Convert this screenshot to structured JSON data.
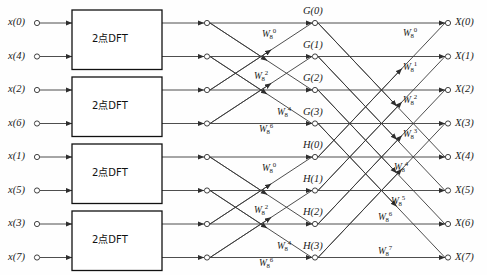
{
  "figure": {
    "type": "signal-flow-graph",
    "width": 487,
    "height": 275,
    "line_color": "#3a3a3a",
    "text_color": "#1a1a1a",
    "background": "#fefefe"
  },
  "inputs": [
    {
      "label": "x(0)",
      "row": 0
    },
    {
      "label": "x(4)",
      "row": 1
    },
    {
      "label": "x(2)",
      "row": 2
    },
    {
      "label": "x(6)",
      "row": 3
    },
    {
      "label": "x(1)",
      "row": 4
    },
    {
      "label": "x(5)",
      "row": 5
    },
    {
      "label": "x(3)",
      "row": 6
    },
    {
      "label": "x(7)",
      "row": 7
    }
  ],
  "outputs": [
    {
      "label": "X(0)",
      "row": 0
    },
    {
      "label": "X(1)",
      "row": 1
    },
    {
      "label": "X(2)",
      "row": 2
    },
    {
      "label": "X(3)",
      "row": 3
    },
    {
      "label": "X(4)",
      "row": 4
    },
    {
      "label": "X(5)",
      "row": 5
    },
    {
      "label": "X(6)",
      "row": 6
    },
    {
      "label": "X(7)",
      "row": 7
    }
  ],
  "dft_blocks": [
    {
      "label": "2点DFT",
      "rows": [
        0,
        1
      ]
    },
    {
      "label": "2点DFT",
      "rows": [
        2,
        3
      ]
    },
    {
      "label": "2点DFT",
      "rows": [
        4,
        5
      ]
    },
    {
      "label": "2点DFT",
      "rows": [
        6,
        7
      ]
    }
  ],
  "intermediate_nodes": [
    {
      "label": "G(0)",
      "row": 0
    },
    {
      "label": "G(1)",
      "row": 1
    },
    {
      "label": "G(2)",
      "row": 2
    },
    {
      "label": "G(3)",
      "row": 3
    },
    {
      "label": "H(0)",
      "row": 4
    },
    {
      "label": "H(1)",
      "row": 5
    },
    {
      "label": "H(2)",
      "row": 6
    },
    {
      "label": "H(3)",
      "row": 7
    }
  ],
  "stage2_twiddles": [
    {
      "base": "W",
      "sub": "8",
      "sup": "0",
      "row": 0,
      "group": "G"
    },
    {
      "base": "W",
      "sub": "8",
      "sup": "2",
      "row": 1,
      "group": "G"
    },
    {
      "base": "W",
      "sub": "8",
      "sup": "4",
      "row": 2,
      "group": "G"
    },
    {
      "base": "W",
      "sub": "8",
      "sup": "6",
      "row": 3,
      "group": "G"
    },
    {
      "base": "W",
      "sub": "8",
      "sup": "0",
      "row": 4,
      "group": "H"
    },
    {
      "base": "W",
      "sub": "8",
      "sup": "2",
      "row": 5,
      "group": "H"
    },
    {
      "base": "W",
      "sub": "8",
      "sup": "4",
      "row": 6,
      "group": "H"
    },
    {
      "base": "W",
      "sub": "8",
      "sup": "6",
      "row": 7,
      "group": "H"
    }
  ],
  "stage3_twiddles": [
    {
      "base": "W",
      "sub": "8",
      "sup": "0",
      "row": 0
    },
    {
      "base": "W",
      "sub": "8",
      "sup": "1",
      "row": 1
    },
    {
      "base": "W",
      "sub": "8",
      "sup": "2",
      "row": 2
    },
    {
      "base": "W",
      "sub": "8",
      "sup": "3",
      "row": 3
    },
    {
      "base": "W",
      "sub": "8",
      "sup": "4",
      "row": 4
    },
    {
      "base": "W",
      "sub": "8",
      "sup": "5",
      "row": 5
    },
    {
      "base": "W",
      "sub": "8",
      "sup": "6",
      "row": 6
    },
    {
      "base": "W",
      "sub": "8",
      "sup": "7",
      "row": 7
    }
  ]
}
